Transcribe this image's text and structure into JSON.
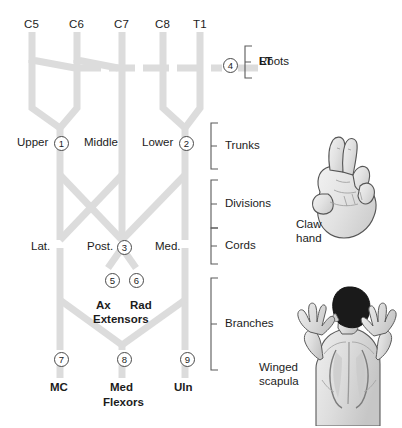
{
  "diagram": {
    "nerve_color": "#dcdcdc",
    "marker_border_color": "#4a4a4a",
    "roots": [
      {
        "id": "c5",
        "label": "C5",
        "x": 32
      },
      {
        "id": "c6",
        "label": "C6",
        "x": 77
      },
      {
        "id": "c7",
        "label": "C7",
        "x": 122
      },
      {
        "id": "c8",
        "label": "C8",
        "x": 163
      },
      {
        "id": "t1",
        "label": "T1",
        "x": 200
      }
    ],
    "tier_brackets": [
      {
        "id": "roots",
        "label": "Roots"
      },
      {
        "id": "trunks",
        "label": "Trunks"
      },
      {
        "id": "divisions",
        "label": "Divisions"
      },
      {
        "id": "cords",
        "label": "Cords"
      },
      {
        "id": "branches",
        "label": "Branches"
      }
    ],
    "trunk_labels": [
      {
        "id": "upper",
        "label": "Upper"
      },
      {
        "id": "middle",
        "label": "Middle"
      },
      {
        "id": "lower",
        "label": "Lower"
      }
    ],
    "cord_labels": [
      {
        "id": "lateral",
        "label": "Lat."
      },
      {
        "id": "posterior",
        "label": "Post."
      },
      {
        "id": "medial",
        "label": "Med."
      }
    ],
    "nerve_labels": [
      {
        "id": "lt",
        "label": "LT"
      },
      {
        "id": "ax",
        "label": "Ax"
      },
      {
        "id": "rad",
        "label": "Rad"
      },
      {
        "id": "extensors",
        "label": "Extensors"
      },
      {
        "id": "mc",
        "label": "MC"
      },
      {
        "id": "med",
        "label": "Med"
      },
      {
        "id": "flexors",
        "label": "Flexors"
      },
      {
        "id": "uln",
        "label": "Uln"
      }
    ],
    "markers": [
      {
        "num": "1",
        "glyph": "1",
        "x": 54,
        "y": 136
      },
      {
        "num": "2",
        "glyph": "2",
        "x": 179,
        "y": 136
      },
      {
        "num": "3",
        "glyph": "3",
        "x": 117,
        "y": 240
      },
      {
        "num": "4",
        "glyph": "4",
        "x": 230,
        "y": 58
      },
      {
        "num": "5",
        "glyph": "5",
        "x": 105,
        "y": 273
      },
      {
        "num": "6",
        "glyph": "6",
        "x": 129,
        "y": 273
      },
      {
        "num": "7",
        "glyph": "7",
        "x": 54,
        "y": 355
      },
      {
        "num": "8",
        "glyph": "8",
        "x": 117,
        "y": 355
      },
      {
        "num": "9",
        "glyph": "9",
        "x": 180,
        "y": 355
      }
    ]
  },
  "illustrations": [
    {
      "id": "claw-hand",
      "label_line1": "Claw",
      "label_line2": "hand"
    },
    {
      "id": "winged-scapula",
      "label_line1": "Winged",
      "label_line2": "scapula"
    }
  ]
}
